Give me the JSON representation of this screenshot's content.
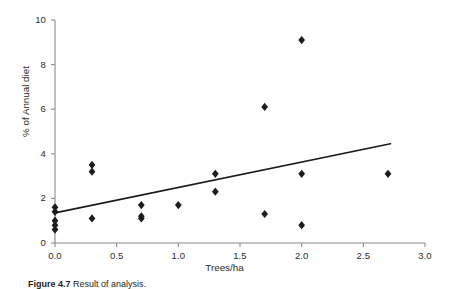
{
  "figure": {
    "caption_label": "Figure 4.7",
    "caption_text": "Result of analysis."
  },
  "chart_data": {
    "type": "scatter",
    "title": "",
    "xlabel": "Trees/ha",
    "ylabel": "% of Annual diet",
    "xlim": [
      0.0,
      3.0
    ],
    "ylim": [
      0,
      10
    ],
    "xticks": [
      "0.0",
      "0.5",
      "1.0",
      "1.5",
      "2.0",
      "2.5",
      "3.0"
    ],
    "xtick_values": [
      0.0,
      0.5,
      1.0,
      1.5,
      2.0,
      2.5,
      3.0
    ],
    "yticks": [
      "0",
      "2",
      "4",
      "6",
      "8",
      "10"
    ],
    "ytick_values": [
      0,
      2,
      4,
      6,
      8,
      10
    ],
    "grid": false,
    "legend": null,
    "marker": "diamond",
    "marker_color": "#1c1c1c",
    "points": [
      {
        "x": 0.0,
        "y": 1.6
      },
      {
        "x": 0.0,
        "y": 1.4
      },
      {
        "x": 0.0,
        "y": 1.0
      },
      {
        "x": 0.0,
        "y": 0.8
      },
      {
        "x": 0.0,
        "y": 0.6
      },
      {
        "x": 0.3,
        "y": 3.5
      },
      {
        "x": 0.3,
        "y": 3.2
      },
      {
        "x": 0.3,
        "y": 1.1
      },
      {
        "x": 0.7,
        "y": 1.7
      },
      {
        "x": 0.7,
        "y": 1.2
      },
      {
        "x": 0.7,
        "y": 1.1
      },
      {
        "x": 1.0,
        "y": 1.7
      },
      {
        "x": 1.3,
        "y": 3.1
      },
      {
        "x": 1.3,
        "y": 2.3
      },
      {
        "x": 1.7,
        "y": 6.1
      },
      {
        "x": 1.7,
        "y": 1.3
      },
      {
        "x": 2.0,
        "y": 9.1
      },
      {
        "x": 2.0,
        "y": 3.1
      },
      {
        "x": 2.0,
        "y": 0.8
      },
      {
        "x": 2.7,
        "y": 3.1
      }
    ],
    "trendline": {
      "type": "linear",
      "x_start": 0.0,
      "y_start": 1.35,
      "x_end": 2.72,
      "y_end": 4.45
    }
  }
}
